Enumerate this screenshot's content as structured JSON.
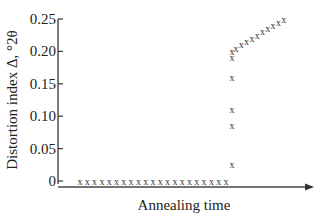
{
  "chart_data": {
    "type": "scatter",
    "title": "",
    "xlabel": "Annealing time",
    "ylabel": "Distortion index Δ, °2θ",
    "ylim": [
      0,
      0.25
    ],
    "yticks": [
      "0",
      "0.05",
      "0.10",
      "0.15",
      "0.20",
      "0.25"
    ],
    "xticks": [],
    "grid": false,
    "legend": null,
    "marker": "x",
    "x_axis_arrow": true,
    "series": [
      {
        "name": "Distortion index",
        "points": [
          {
            "x": 1,
            "y": 0
          },
          {
            "x": 2,
            "y": 0
          },
          {
            "x": 3,
            "y": 0
          },
          {
            "x": 4,
            "y": 0
          },
          {
            "x": 5,
            "y": 0
          },
          {
            "x": 6,
            "y": 0
          },
          {
            "x": 7,
            "y": 0
          },
          {
            "x": 8,
            "y": 0
          },
          {
            "x": 9,
            "y": 0
          },
          {
            "x": 10,
            "y": 0
          },
          {
            "x": 11,
            "y": 0
          },
          {
            "x": 12,
            "y": 0
          },
          {
            "x": 13,
            "y": 0
          },
          {
            "x": 14,
            "y": 0
          },
          {
            "x": 15,
            "y": 0
          },
          {
            "x": 16,
            "y": 0
          },
          {
            "x": 17,
            "y": 0
          },
          {
            "x": 18,
            "y": 0
          },
          {
            "x": 19,
            "y": 0
          },
          {
            "x": 20,
            "y": 0
          },
          {
            "x": 21,
            "y": 0
          },
          {
            "x": 22,
            "y": 0.025
          },
          {
            "x": 22,
            "y": 0.085
          },
          {
            "x": 22,
            "y": 0.11
          },
          {
            "x": 22,
            "y": 0.16
          },
          {
            "x": 22,
            "y": 0.19
          },
          {
            "x": 22,
            "y": 0.2
          },
          {
            "x": 23,
            "y": 0.205
          },
          {
            "x": 24,
            "y": 0.21
          },
          {
            "x": 25,
            "y": 0.215
          },
          {
            "x": 26,
            "y": 0.22
          },
          {
            "x": 27,
            "y": 0.225
          },
          {
            "x": 28,
            "y": 0.23
          },
          {
            "x": 29,
            "y": 0.235
          },
          {
            "x": 30,
            "y": 0.24
          },
          {
            "x": 31,
            "y": 0.245
          },
          {
            "x": 32,
            "y": 0.25
          }
        ]
      }
    ]
  },
  "layout": {
    "plot": {
      "x0": 58,
      "x1": 330,
      "y0": 181,
      "y1": 19
    },
    "x_range": [
      -4,
      36
    ]
  }
}
